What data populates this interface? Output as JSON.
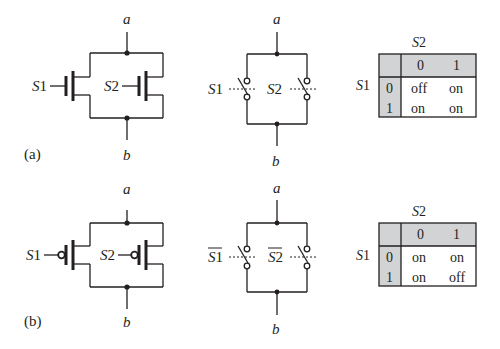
{
  "figure": {
    "panels": [
      {
        "id": "a",
        "caption": "(a)",
        "transistor_circuit": {
          "type": "nMOS parallel",
          "top_node": "a",
          "bottom_node": "b",
          "gate_labels": [
            "S1",
            "S2"
          ]
        },
        "switch_circuit": {
          "top_node": "a",
          "bottom_node": "b",
          "switch_labels": [
            "S1",
            "S2"
          ],
          "overbar": false
        },
        "truth_table": {
          "col_header": "S2",
          "row_header": "S1",
          "col_values": [
            "0",
            "1"
          ],
          "row_values": [
            "0",
            "1"
          ],
          "cells": [
            [
              "off",
              "on"
            ],
            [
              "on",
              "on"
            ]
          ]
        }
      },
      {
        "id": "b",
        "caption": "(b)",
        "transistor_circuit": {
          "type": "pMOS parallel",
          "top_node": "a",
          "bottom_node": "b",
          "gate_labels": [
            "S1",
            "S2"
          ]
        },
        "switch_circuit": {
          "top_node": "a",
          "bottom_node": "b",
          "switch_labels": [
            "S1",
            "S2"
          ],
          "overbar": true
        },
        "truth_table": {
          "col_header": "S2",
          "row_header": "S1",
          "col_values": [
            "0",
            "1"
          ],
          "row_values": [
            "0",
            "1"
          ],
          "cells": [
            [
              "on",
              "on"
            ],
            [
              "on",
              "off"
            ]
          ]
        }
      }
    ],
    "colors": {
      "line": "#231f20",
      "table_header_fill": "#d2d3d5",
      "background": "#ffffff"
    }
  }
}
